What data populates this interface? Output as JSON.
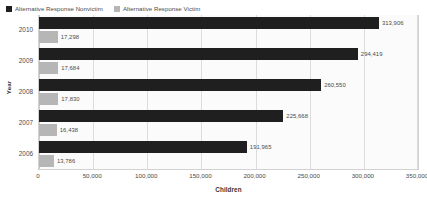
{
  "chart_data": {
    "type": "bar",
    "orientation": "horizontal",
    "title": "",
    "xlabel": "Children",
    "ylabel": "Year",
    "categories": [
      "2010",
      "2009",
      "2008",
      "2007",
      "2006"
    ],
    "series": [
      {
        "name": "Alternative Response Nonvictim",
        "color": "#1f1f1f",
        "values": [
          313906,
          294419,
          260550,
          225668,
          191965
        ],
        "labels": [
          "313,906",
          "294,419",
          "260,550",
          "225,668",
          "191,965"
        ]
      },
      {
        "name": "Alternative Response Victim",
        "color": "#b6b6b6",
        "values": [
          17298,
          17684,
          17830,
          16438,
          13786
        ],
        "labels": [
          "17,298",
          "17,684",
          "17,830",
          "16,438",
          "13,786"
        ]
      }
    ],
    "xlim": [
      0,
      350000
    ],
    "xticks": [
      0,
      50000,
      100000,
      150000,
      200000,
      250000,
      300000,
      350000
    ],
    "xtick_labels": [
      "0",
      "50,000",
      "100,000",
      "150,000",
      "200,000",
      "250,000",
      "300,000",
      "350,000"
    ],
    "grid": true,
    "legend_position": "top-left"
  },
  "legend": {
    "entries": [
      {
        "label": "Alternative Response Nonvictim",
        "color": "#1f1f1f"
      },
      {
        "label": "Alternative Response Victim",
        "color": "#b6b6b6"
      }
    ]
  }
}
